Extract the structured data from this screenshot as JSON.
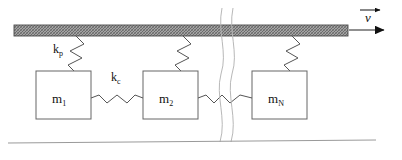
{
  "figure": {
    "type": "mechanical-schematic",
    "title": "",
    "background_color": "#ffffff",
    "line_color": "#555555",
    "text_color": "#111111",
    "plate_fill": "#9a9a9a"
  },
  "plate": {
    "name": "moving-plate",
    "x": 14,
    "y": 25,
    "width": 334,
    "height": 11,
    "hatch": "cross-hatch"
  },
  "velocity": {
    "symbol": "v",
    "overbar": true,
    "arrow_direction": "right",
    "label_x": 370,
    "label_y": 17
  },
  "masses": [
    {
      "symbol": "m",
      "subscript": "1",
      "x": 36,
      "y": 71,
      "width": 55,
      "height": 48
    },
    {
      "symbol": "m",
      "subscript": "2",
      "x": 143,
      "y": 71,
      "width": 55,
      "height": 48
    },
    {
      "symbol": "m",
      "subscript": "N",
      "x": 252,
      "y": 71,
      "width": 55,
      "height": 48
    }
  ],
  "springs": {
    "plate_spring": {
      "symbol": "k",
      "subscript": "p",
      "label_x": 59,
      "label_y": 53,
      "count": 3,
      "orientation": "diagonal-vertical"
    },
    "coupling_spring": {
      "symbol": "k",
      "subscript": "c",
      "label_x": 116,
      "label_y": 81,
      "count": 2,
      "orientation": "horizontal"
    }
  },
  "break_symbol": {
    "name": "break-lines",
    "x": 222,
    "description": "wavy vertical break indicating repeated elements omitted"
  },
  "ground": {
    "name": "ground-line",
    "x1": 8,
    "x2": 376,
    "y": 142
  }
}
